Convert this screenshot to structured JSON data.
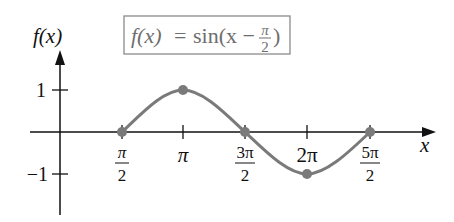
{
  "figure": {
    "title_box": {
      "lhs": "f(x)",
      "equals": "=",
      "rhs_prefix": "sin(x −",
      "frac_num": "π",
      "frac_den": "2",
      "rhs_suffix": ")"
    },
    "y_axis_label": "f(x)",
    "x_axis_label": "x",
    "colors": {
      "axis": "#111111",
      "curve": "#7a7a7a",
      "point": "#7a7a7a",
      "box_border": "#8a8a8a",
      "box_text": "#6e6e6e"
    }
  },
  "axes": {
    "x_ticks": [
      {
        "num": "π",
        "den": "2",
        "value": 1.5708
      },
      {
        "num": "π",
        "den": "",
        "value": 3.1416
      },
      {
        "num": "3π",
        "den": "2",
        "value": 4.7124
      },
      {
        "num": "2π",
        "den": "",
        "value": 6.2832
      },
      {
        "num": "5π",
        "den": "2",
        "value": 7.854
      }
    ],
    "y_ticks": [
      {
        "label": "1",
        "value": 1
      },
      {
        "label": "−1",
        "value": -1
      }
    ]
  },
  "points": [
    {
      "x": "π/2",
      "y": 0
    },
    {
      "x": "π",
      "y": 1
    },
    {
      "x": "3π/2",
      "y": 0
    },
    {
      "x": "2π",
      "y": -1
    },
    {
      "x": "5π/2",
      "y": 0
    }
  ]
}
